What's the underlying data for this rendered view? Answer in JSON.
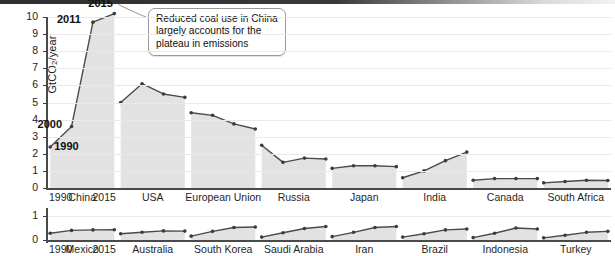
{
  "figure": {
    "y_axis_label": "GtCO",
    "y_axis_label_sub": "2",
    "y_axis_label_tail": "/year",
    "callout_text": "Reduced coal use in China largely accounts for the plateau in emissions",
    "point_labels": {
      "y1990": "1990",
      "y2000": "2000",
      "y2011": "2011",
      "y2015": "2015"
    },
    "axis_end_labels": {
      "top_left": "1990",
      "top_right": "2015",
      "bottom_left": "1990",
      "bottom_right": "2015"
    }
  },
  "chart_data": {
    "type": "area",
    "title": "",
    "xlabel": "",
    "ylabel": "GtCO2/year",
    "x": [
      1990,
      2000,
      2011,
      2015
    ],
    "grid": true,
    "legend": "none",
    "panels": [
      {
        "name": "top-panel",
        "ylim": [
          0,
          10
        ],
        "yticks": [
          "0",
          "1",
          "2",
          "3",
          "4",
          "5",
          "6",
          "7",
          "8",
          "9",
          "10"
        ],
        "series": [
          {
            "name": "China",
            "values": [
              2.4,
              3.6,
              9.7,
              10.2
            ]
          },
          {
            "name": "USA",
            "values": [
              5.0,
              6.1,
              5.5,
              5.3
            ]
          },
          {
            "name": "European Union",
            "values": [
              4.4,
              4.25,
              3.75,
              3.45
            ]
          },
          {
            "name": "Russia",
            "values": [
              2.5,
              1.5,
              1.75,
              1.7
            ]
          },
          {
            "name": "Japan",
            "values": [
              1.15,
              1.3,
              1.3,
              1.25
            ]
          },
          {
            "name": "India",
            "values": [
              0.6,
              1.0,
              1.6,
              2.1
            ]
          },
          {
            "name": "Canada",
            "values": [
              0.45,
              0.55,
              0.55,
              0.55
            ]
          },
          {
            "name": "South Africa",
            "values": [
              0.3,
              0.38,
              0.45,
              0.44
            ]
          }
        ]
      },
      {
        "name": "bottom-panel",
        "ylim": [
          0,
          1
        ],
        "yticks": [
          "0",
          "1"
        ],
        "series": [
          {
            "name": "Mexico",
            "values": [
              0.28,
              0.4,
              0.42,
              0.43
            ]
          },
          {
            "name": "Australia",
            "values": [
              0.26,
              0.32,
              0.38,
              0.37
            ]
          },
          {
            "name": "South Korea",
            "values": [
              0.16,
              0.36,
              0.52,
              0.54
            ]
          },
          {
            "name": "Saudi Arabia",
            "values": [
              0.12,
              0.3,
              0.48,
              0.56
            ]
          },
          {
            "name": "Iran",
            "values": [
              0.14,
              0.32,
              0.52,
              0.56
            ]
          },
          {
            "name": "Brazil",
            "values": [
              0.12,
              0.26,
              0.42,
              0.46
            ]
          },
          {
            "name": "Indonesia",
            "values": [
              0.1,
              0.28,
              0.5,
              0.46
            ]
          },
          {
            "name": "Turkey",
            "values": [
              0.09,
              0.2,
              0.32,
              0.36
            ]
          }
        ]
      }
    ]
  },
  "colors": {
    "area_fill": "#e2e2e2",
    "line": "#4a4a4a",
    "grid": "#e9e9e9",
    "axis": "#4a4a4a",
    "text": "#1d1d1d"
  }
}
